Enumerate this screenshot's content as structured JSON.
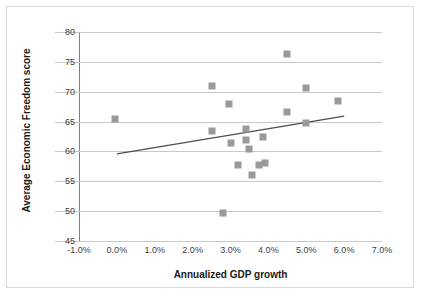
{
  "chart_data": {
    "type": "scatter",
    "title": "",
    "xlabel": "Annualized GDP growth",
    "ylabel": "Average Economic Freedom score",
    "xlim": [
      -1.0,
      7.0
    ],
    "ylim": [
      45,
      80
    ],
    "xtick_labels": [
      "-1.0%",
      "0.0%",
      "1.0%",
      "2.0%",
      "3.0%",
      "4.0%",
      "5.0%",
      "6.0%",
      "7.0%"
    ],
    "xticks": [
      -1.0,
      0.0,
      1.0,
      2.0,
      3.0,
      4.0,
      5.0,
      6.0,
      7.0
    ],
    "ytick_labels": [
      "45",
      "50",
      "55",
      "60",
      "65",
      "70",
      "75",
      "80"
    ],
    "yticks": [
      45,
      50,
      55,
      60,
      65,
      70,
      75,
      80
    ],
    "grid": "horizontal",
    "legend": "none",
    "marker_color": "#9a9a9a",
    "marker_shape": "square",
    "trendline_color": "#4d4d4d",
    "points": [
      {
        "x": -0.05,
        "y": 65.5
      },
      {
        "x": 2.5,
        "y": 71.0
      },
      {
        "x": 2.5,
        "y": 63.4
      },
      {
        "x": 2.8,
        "y": 49.7
      },
      {
        "x": 2.95,
        "y": 67.9
      },
      {
        "x": 3.0,
        "y": 61.4
      },
      {
        "x": 3.2,
        "y": 57.8
      },
      {
        "x": 3.4,
        "y": 63.8
      },
      {
        "x": 3.42,
        "y": 61.9
      },
      {
        "x": 3.5,
        "y": 60.4
      },
      {
        "x": 3.58,
        "y": 56.0
      },
      {
        "x": 3.75,
        "y": 57.7
      },
      {
        "x": 3.85,
        "y": 62.4
      },
      {
        "x": 3.9,
        "y": 58.0
      },
      {
        "x": 4.5,
        "y": 76.3
      },
      {
        "x": 4.5,
        "y": 66.6
      },
      {
        "x": 5.0,
        "y": 70.6
      },
      {
        "x": 5.0,
        "y": 64.8
      },
      {
        "x": 5.85,
        "y": 68.4
      }
    ],
    "trendline": {
      "x0": 0.0,
      "y0": 59.6,
      "x1": 6.0,
      "y1": 65.9
    }
  }
}
